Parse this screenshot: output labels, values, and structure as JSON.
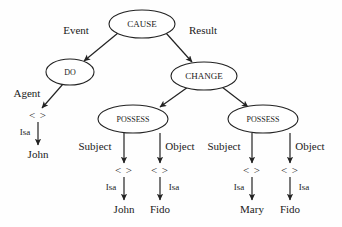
{
  "diagram": {
    "type": "semantic-network-tree",
    "background_color": "#fefefe",
    "stroke_color": "#222222",
    "text_color": "#1a1a1a",
    "nodes": [
      {
        "id": "cause",
        "label": "CAUSE",
        "shape": "ellipse",
        "cx": 142,
        "cy": 24,
        "rx": 33,
        "ry": 14,
        "font_size": 9
      },
      {
        "id": "do",
        "label": "DO",
        "shape": "ellipse",
        "cx": 70,
        "cy": 72,
        "rx": 24,
        "ry": 13,
        "font_size": 8
      },
      {
        "id": "change",
        "label": "CHANGE",
        "shape": "ellipse",
        "cx": 204,
        "cy": 76,
        "rx": 33,
        "ry": 14,
        "font_size": 9
      },
      {
        "id": "possess1",
        "label": "POSSESS",
        "shape": "ellipse",
        "cx": 133,
        "cy": 119,
        "rx": 35,
        "ry": 14,
        "font_size": 8
      },
      {
        "id": "possess2",
        "label": "POSSESS",
        "shape": "ellipse",
        "cx": 263,
        "cy": 119,
        "rx": 35,
        "ry": 14,
        "font_size": 8
      }
    ],
    "edges": [
      {
        "id": "cause-do",
        "from": "cause",
        "to": "do",
        "label": "Event",
        "label_x": 76,
        "label_y": 31
      },
      {
        "id": "cause-change",
        "from": "cause",
        "to": "change",
        "label": "Result",
        "label_x": 203,
        "label_y": 31
      },
      {
        "id": "do-agent",
        "from": "do",
        "to": "var-agent",
        "label": "Agent",
        "label_x": 27,
        "label_y": 94
      },
      {
        "id": "change-possess1",
        "from": "change",
        "to": "possess1",
        "label": "",
        "label_x": 0,
        "label_y": 0
      },
      {
        "id": "change-possess2",
        "from": "change",
        "to": "possess2",
        "label": "",
        "label_x": 0,
        "label_y": 0
      },
      {
        "id": "possess1-subject",
        "from": "possess1",
        "to": "var-p1s",
        "label": "Subject",
        "label_x": 95,
        "label_y": 146
      },
      {
        "id": "possess1-object",
        "from": "possess1",
        "to": "var-p1o",
        "label": "Object",
        "label_x": 178,
        "label_y": 146
      },
      {
        "id": "possess2-subject",
        "from": "possess2",
        "to": "var-p2s",
        "label": "Subject",
        "label_x": 225,
        "label_y": 146
      },
      {
        "id": "possess2-object",
        "from": "possess2",
        "to": "var-p2o",
        "label": "Object",
        "label_x": 308,
        "label_y": 146
      }
    ],
    "variables": [
      {
        "id": "var-agent",
        "symbol": "< >",
        "x": 38,
        "y": 116
      },
      {
        "id": "var-p1s",
        "symbol": "< >",
        "x": 124,
        "y": 171
      },
      {
        "id": "var-p1o",
        "symbol": "< >",
        "x": 160,
        "y": 171
      },
      {
        "id": "var-p2s",
        "symbol": "< >",
        "x": 252,
        "y": 171
      },
      {
        "id": "var-p2o",
        "symbol": "< >",
        "x": 290,
        "y": 171
      }
    ],
    "isa_links": [
      {
        "id": "isa-agent",
        "label": "Isa",
        "label_x": 26,
        "label_y": 132,
        "line_x": 38,
        "y_from": 122,
        "y_to": 144,
        "leaf": "John",
        "leaf_x": 38,
        "leaf_y": 154
      },
      {
        "id": "isa-p1s",
        "label": "Isa",
        "label_x": 111,
        "label_y": 187,
        "line_x": 124,
        "y_from": 177,
        "y_to": 199,
        "leaf": "John",
        "leaf_x": 124,
        "leaf_y": 209
      },
      {
        "id": "isa-p1o",
        "label": "Isa",
        "label_x": 174,
        "label_y": 187,
        "line_x": 160,
        "y_from": 177,
        "y_to": 199,
        "leaf": "Fido",
        "leaf_x": 160,
        "leaf_y": 209
      },
      {
        "id": "isa-p2s",
        "label": "Isa",
        "label_x": 239,
        "label_y": 187,
        "line_x": 252,
        "y_from": 177,
        "y_to": 199,
        "leaf": "Mary",
        "leaf_x": 252,
        "leaf_y": 209
      },
      {
        "id": "isa-p2o",
        "label": "Isa",
        "label_x": 304,
        "label_y": 187,
        "line_x": 290,
        "y_from": 177,
        "y_to": 199,
        "leaf": "Fido",
        "leaf_x": 290,
        "leaf_y": 209
      }
    ],
    "labels": {
      "cause": "CAUSE",
      "do": "DO",
      "change": "CHANGE",
      "possess_left": "POSSESS",
      "possess_right": "POSSESS",
      "event": "Event",
      "result": "Result",
      "agent": "Agent",
      "subject_left": "Subject",
      "object_left": "Object",
      "subject_right": "Subject",
      "object_right": "Object",
      "isa": "Isa",
      "variable": "< >",
      "john_left": "John",
      "john_mid": "John",
      "fido_mid": "Fido",
      "mary": "Mary",
      "fido_right": "Fido"
    }
  }
}
